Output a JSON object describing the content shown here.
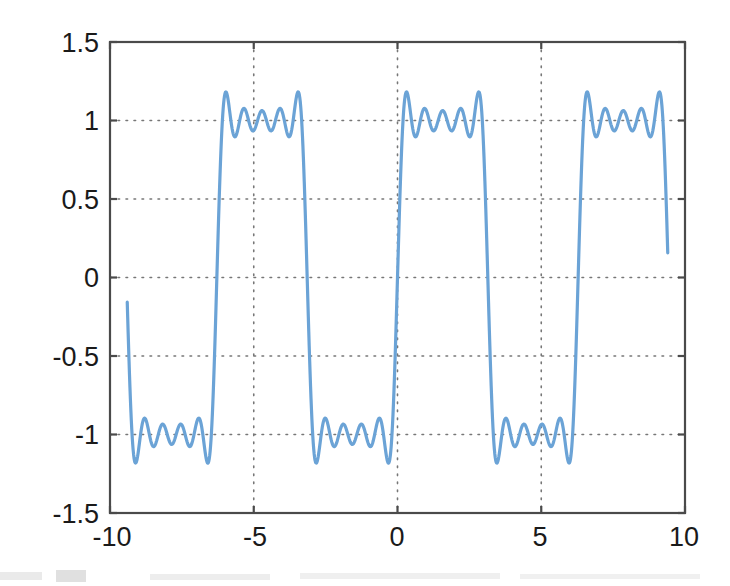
{
  "figure": {
    "title": "",
    "background_color": "#ffffff"
  },
  "axes": {
    "frame_color": "#4a4a4a",
    "grid_color": "#777777",
    "grid_style": "dotted",
    "xlabel": "",
    "ylabel": "",
    "x_tick_labels": [
      "-10",
      "-5",
      "0",
      "5",
      "10"
    ],
    "y_tick_labels": [
      "1.5",
      "1",
      "0.5",
      "0",
      "-0.5",
      "-1",
      "-1.5"
    ]
  },
  "chart_data": {
    "type": "line",
    "title": "",
    "xlabel": "",
    "ylabel": "",
    "xlim": [
      -10,
      10
    ],
    "ylim": [
      -1.5,
      1.5
    ],
    "xticks": [
      -10,
      -5,
      0,
      5,
      10
    ],
    "yticks": [
      -1.5,
      -1,
      -0.5,
      0,
      0.5,
      1,
      1.5
    ],
    "grid": true,
    "legend": null,
    "line_color": "#6BA3D6",
    "line_width": 3.2,
    "series": [
      {
        "name": "square wave partial sum",
        "formula": "(4/pi) * [ sin(x) + sin(3x)/3 + sin(5x)/5 + sin(7x)/7 + sin(9x)/9 ]",
        "harmonics": [
          1,
          3,
          5,
          7,
          9
        ],
        "amplitude_scale": 1.2732,
        "x_start": -9.4,
        "x_end": 9.4,
        "n_samples": 1200,
        "overshoot_peak": 1.19,
        "ripple_mid_peak": 1.08,
        "ripple_trough": 0.9,
        "plateau_level": 1.0,
        "period": 6.283,
        "key_points": [
          {
            "x": -9.4,
            "y": 0.0,
            "note": "left endpoint"
          },
          {
            "x": -9.1,
            "y": -1.19,
            "note": "overshoot minimum"
          },
          {
            "x": -8.5,
            "y": -0.9,
            "note": "ripple trough"
          },
          {
            "x": -7.9,
            "y": -1.08,
            "note": "ripple peak"
          },
          {
            "x": -7.2,
            "y": -0.9,
            "note": "ripple trough"
          },
          {
            "x": -6.6,
            "y": -1.19,
            "note": "overshoot minimum"
          },
          {
            "x": -6.28,
            "y": 0.0,
            "note": "zero crossing"
          },
          {
            "x": -6.0,
            "y": 1.19,
            "note": "overshoot maximum"
          },
          {
            "x": -5.35,
            "y": 0.9,
            "note": "ripple trough"
          },
          {
            "x": -4.71,
            "y": 1.08,
            "note": "ripple peak"
          },
          {
            "x": -4.05,
            "y": 0.9,
            "note": "ripple trough"
          },
          {
            "x": -3.45,
            "y": 1.19,
            "note": "overshoot maximum"
          },
          {
            "x": -3.14,
            "y": 0.0,
            "note": "zero crossing"
          },
          {
            "x": -2.85,
            "y": -1.19,
            "note": "overshoot minimum"
          },
          {
            "x": -2.2,
            "y": -0.9,
            "note": "ripple trough"
          },
          {
            "x": -1.57,
            "y": -1.08,
            "note": "ripple peak"
          },
          {
            "x": -0.92,
            "y": -0.9,
            "note": "ripple trough"
          },
          {
            "x": -0.3,
            "y": -1.19,
            "note": "overshoot minimum"
          },
          {
            "x": 0.0,
            "y": 0.0,
            "note": "zero crossing"
          },
          {
            "x": 0.3,
            "y": 1.19,
            "note": "overshoot maximum"
          },
          {
            "x": 0.92,
            "y": 0.9,
            "note": "ripple trough"
          },
          {
            "x": 1.57,
            "y": 1.08,
            "note": "ripple peak"
          },
          {
            "x": 2.2,
            "y": 0.9,
            "note": "ripple trough"
          },
          {
            "x": 2.85,
            "y": 1.19,
            "note": "overshoot maximum"
          },
          {
            "x": 3.14,
            "y": 0.0,
            "note": "zero crossing"
          },
          {
            "x": 3.45,
            "y": -1.19,
            "note": "overshoot minimum"
          },
          {
            "x": 4.05,
            "y": -0.9,
            "note": "ripple trough"
          },
          {
            "x": 4.71,
            "y": -1.08,
            "note": "ripple peak"
          },
          {
            "x": 5.35,
            "y": -0.9,
            "note": "ripple trough"
          },
          {
            "x": 6.0,
            "y": -1.19,
            "note": "overshoot minimum"
          },
          {
            "x": 6.28,
            "y": 0.0,
            "note": "zero crossing"
          },
          {
            "x": 6.6,
            "y": 1.19,
            "note": "overshoot maximum"
          },
          {
            "x": 7.2,
            "y": 0.9,
            "note": "ripple trough"
          },
          {
            "x": 7.85,
            "y": 1.08,
            "note": "ripple peak"
          },
          {
            "x": 8.5,
            "y": 0.9,
            "note": "ripple trough"
          },
          {
            "x": 9.1,
            "y": 1.19,
            "note": "overshoot maximum"
          },
          {
            "x": 9.4,
            "y": 0.0,
            "note": "right endpoint"
          }
        ]
      }
    ]
  },
  "plot_geometry": {
    "left_px": 110,
    "right_px": 685,
    "top_px": 42,
    "bottom_px": 513
  }
}
